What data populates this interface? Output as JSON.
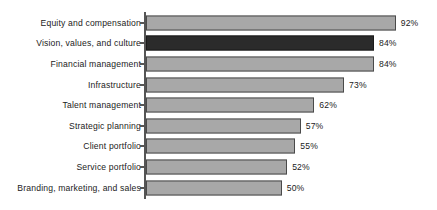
{
  "chart_data": {
    "type": "bar",
    "orientation": "horizontal",
    "title": "",
    "subtitle": "",
    "xlabel": "",
    "ylabel": "",
    "xlim": [
      0,
      100
    ],
    "grid": false,
    "legend": null,
    "value_suffix": "%",
    "colors": {
      "bar_fill": "#a8a8a8",
      "bar_border": "#4a4a4a",
      "highlight_fill": "#2b2b2b",
      "highlight_border": "#1a1a1a",
      "axis": "#555555",
      "text": "#1b1b1b",
      "background": "#ffffff"
    },
    "categories": [
      "Equity and compensation",
      "Vision, values, and culture",
      "Financial management",
      "Infrastructure",
      "Talent management",
      "Strategic planning",
      "Client portfolio",
      "Service portfolio",
      "Branding, marketing, and sales"
    ],
    "values": [
      92,
      84,
      84,
      73,
      62,
      57,
      55,
      52,
      50
    ],
    "data_labels": [
      "92%",
      "84%",
      "84%",
      "73%",
      "62%",
      "57%",
      "55%",
      "52%",
      "50%"
    ],
    "highlighted_index": 1,
    "bars": [
      {
        "label": "Equity and compensation",
        "value": 92,
        "display": "92%",
        "highlight": false
      },
      {
        "label": "Vision, values, and culture",
        "value": 84,
        "display": "84%",
        "highlight": true
      },
      {
        "label": "Financial management",
        "value": 84,
        "display": "84%",
        "highlight": false
      },
      {
        "label": "Infrastructure",
        "value": 73,
        "display": "73%",
        "highlight": false
      },
      {
        "label": "Talent management",
        "value": 62,
        "display": "62%",
        "highlight": false
      },
      {
        "label": "Strategic planning",
        "value": 57,
        "display": "57%",
        "highlight": false
      },
      {
        "label": "Client portfolio",
        "value": 55,
        "display": "55%",
        "highlight": false
      },
      {
        "label": "Service portfolio",
        "value": 52,
        "display": "52%",
        "highlight": false
      },
      {
        "label": "Branding, marketing, and sales",
        "value": 50,
        "display": "50%",
        "highlight": false
      }
    ]
  }
}
